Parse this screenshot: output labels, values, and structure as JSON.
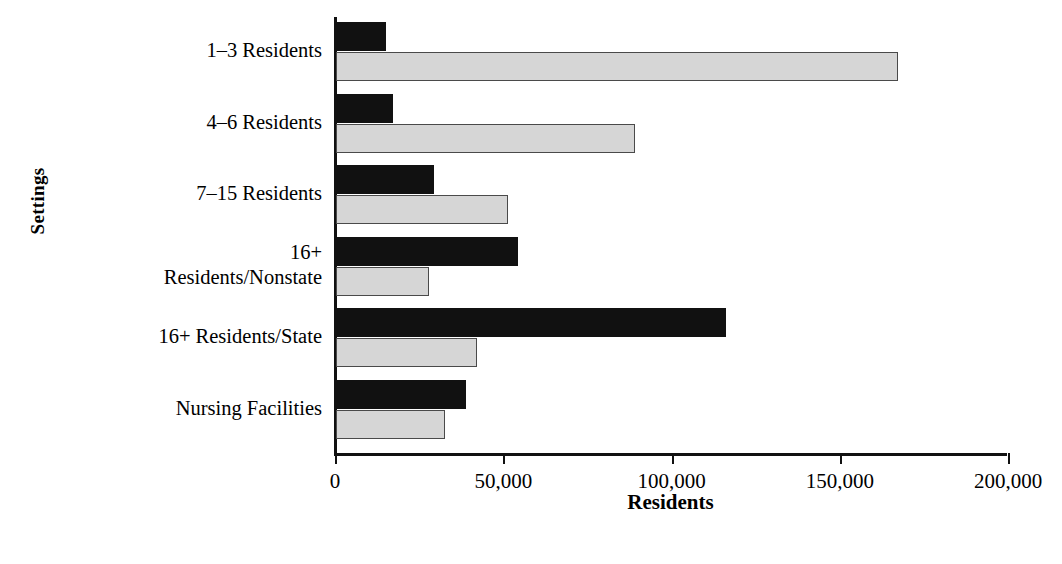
{
  "chart_data": {
    "type": "bar",
    "orientation": "horizontal",
    "title": "",
    "xlabel": "Residents",
    "ylabel": "Settings",
    "xlim": [
      0,
      200000
    ],
    "xticks": [
      0,
      50000,
      100000,
      150000,
      200000
    ],
    "xtick_labels": [
      "0",
      "50,000",
      "100,000",
      "150,000",
      "200,000"
    ],
    "grid": false,
    "legend": "none",
    "categories": [
      "1–3 Residents",
      "4–6 Residents",
      "7–15 Residents",
      "16+\nResidents/Nonstate",
      "16+ Residents/State",
      "Nursing Facilities"
    ],
    "series": [
      {
        "name": "dark-series",
        "color": "#111111",
        "values": [
          15000,
          17000,
          29000,
          54000,
          116000,
          38500
        ]
      },
      {
        "name": "light-series",
        "color": "#d6d6d6",
        "values": [
          167000,
          89000,
          51000,
          27500,
          42000,
          32500
        ]
      }
    ]
  },
  "axis": {
    "x_title": "Residents",
    "y_title": "Settings"
  }
}
